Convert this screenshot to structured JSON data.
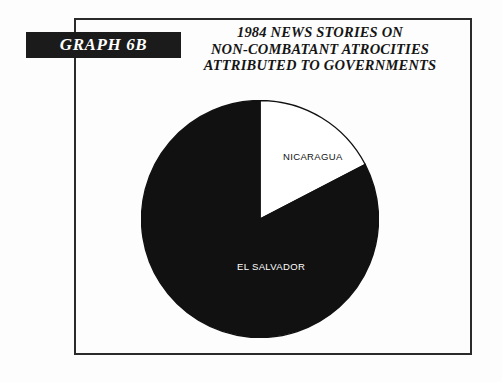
{
  "graph_tag": {
    "label": "GRAPH 6B"
  },
  "title": {
    "line1": "1984 NEWS STORIES ON",
    "line2": "NON-COMBATANT ATROCITIES",
    "line3": "ATTRIBUTED TO GOVERNMENTS"
  },
  "labels": {
    "nicaragua": "NICARAGUA",
    "el_salvador": "EL SALVADOR"
  },
  "colors": {
    "nicaragua_slice": "#ffffff",
    "el_salvador_slice": "#111111",
    "frame_border": "#2b2b2b",
    "tag_background": "#1b1b1b",
    "tag_text": "#ffffff",
    "page_background": "#fdfdfd"
  },
  "chart_data": {
    "type": "pie",
    "title": "1984 NEWS STORIES ON NON-COMBATANT ATROCITIES ATTRIBUTED TO GOVERNMENTS",
    "categories": [
      "NICARAGUA",
      "EL SALVADOR"
    ],
    "values": [
      17.4,
      82.6
    ],
    "value_unit": "percent",
    "angles_deg": [
      62.5,
      297.5
    ],
    "start_angle_deg": 0,
    "direction": "clockwise",
    "slice_colors": [
      "#ffffff",
      "#111111"
    ],
    "slice_label_colors": [
      "#121212",
      "#ffffff"
    ],
    "labels_shown": [
      "NICARAGUA",
      "EL SALVADOR"
    ],
    "value_labels_shown": false,
    "legend": "none",
    "grid": false,
    "xlabel": "",
    "ylabel": ""
  }
}
